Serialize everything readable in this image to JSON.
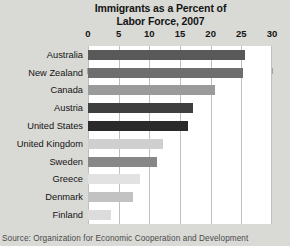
{
  "chart_data": {
    "type": "bar",
    "orientation": "horizontal",
    "title": "Immigrants as a Percent of Labor Force, 2007",
    "title_lines": [
      "Immigrants as a Percent of",
      "Labor Force, 2007"
    ],
    "xlabel": "",
    "ylabel": "",
    "xlim": [
      0,
      30
    ],
    "xticks": [
      0,
      5,
      10,
      15,
      20,
      25,
      30
    ],
    "xtick_labels": [
      "0",
      "5",
      "10",
      "15",
      "20",
      "25",
      "30"
    ],
    "grid": true,
    "grid_axis": "x",
    "legend": "none",
    "categories": [
      "Australia",
      "New Zealand",
      "Canada",
      "Austria",
      "United States",
      "United Kingdom",
      "Sweden",
      "Greece",
      "Denmark",
      "Finland"
    ],
    "values": [
      25.6,
      25.3,
      20.7,
      17.1,
      16.3,
      12.2,
      11.3,
      8.5,
      7.3,
      3.8
    ],
    "bar_colors": [
      "#595959",
      "#6e6e6e",
      "#9a9a9a",
      "#3f3f3f",
      "#2a2a2a",
      "#cfcfcf",
      "#878787",
      "#e2e2e2",
      "#c2c2c2",
      "#dcdcdc"
    ],
    "source": "Source: Organization for Economic Cooperation and Development"
  },
  "figure": {
    "background_color": "#d9d9d5",
    "plot_background_color": "#ffffff",
    "gridline_color": "#bfbfbf",
    "text_color": "#141414"
  }
}
